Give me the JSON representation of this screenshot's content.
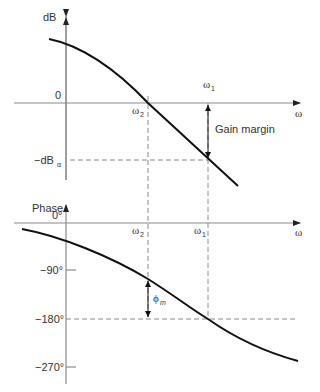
{
  "magnitude_plot": {
    "y_axis_label": "dB",
    "zero_label": "0",
    "x_axis_label": "ω",
    "neg_db_label": "−dB",
    "neg_db_subscript": "α",
    "omega2_label": "ω",
    "omega2_sub": "2",
    "omega1_label": "ω",
    "omega1_sub": "1",
    "gain_margin_label": "Gain margin"
  },
  "phase_plot": {
    "y_axis_label": "Phase",
    "zero_label": "0°",
    "x_axis_label": "ω",
    "omega2_label": "ω",
    "omega2_sub": "2",
    "omega1_label": "ω",
    "omega1_sub": "1",
    "ticks": [
      "−90°",
      "−180°",
      "−270°"
    ],
    "phase_margin_label": "ϕ",
    "phase_margin_sub": "m"
  },
  "colors": {
    "curve": "#111111",
    "axis": "#8a8a8a",
    "text": "#333333",
    "background": "#ffffff"
  }
}
